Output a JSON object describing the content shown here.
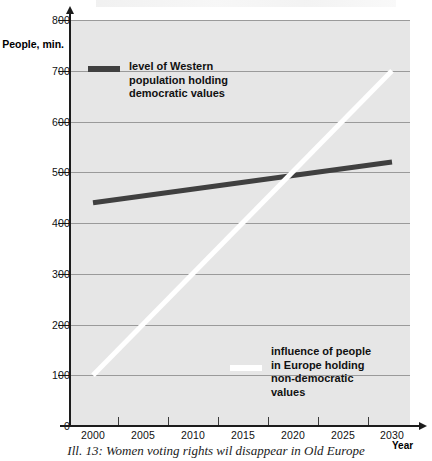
{
  "figure": {
    "caption": "Ill. 13: Women voting rights wil disappear in Old Europe"
  },
  "chart_data": {
    "type": "line",
    "title": "",
    "xlabel": "Year",
    "ylabel": "People, min.",
    "xlim": [
      2000,
      2030
    ],
    "ylim": [
      0,
      800
    ],
    "grid": true,
    "legend_position": "inside-plot",
    "x_ticks": [
      "2000",
      "2005",
      "2010",
      "2015",
      "2020",
      "2025",
      "2030"
    ],
    "y_ticks": [
      "0",
      "100",
      "200",
      "300",
      "400",
      "500",
      "600",
      "700",
      "800"
    ],
    "series": [
      {
        "name": "level of Western\npopulation holding\ndemocratic values",
        "color": "#404040",
        "x": [
          2000,
          2030
        ],
        "values": [
          440,
          520
        ]
      },
      {
        "name": "influence of people\nin Europe holding\nnon-democratic\nvalues",
        "color": "#ffffff",
        "x": [
          2000,
          2030
        ],
        "values": [
          100,
          700
        ]
      }
    ]
  },
  "axes": {
    "y_title": "People,\nmin.",
    "x_title": "Year"
  }
}
